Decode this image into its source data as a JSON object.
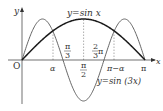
{
  "diagram": {
    "axes": {
      "x_label": "x",
      "y_label": "y",
      "origin_label": "O"
    },
    "curves": [
      {
        "name": "sin-x",
        "label": "y=sin x",
        "color": "#1a1a1a"
      },
      {
        "name": "sin-3x",
        "label": "y=sin (3x)",
        "color": "#555555"
      }
    ],
    "x_ticks": {
      "a": "α",
      "pi_over_3_num": "π",
      "pi_over_3_den": "3",
      "pi_over_2_num": "π",
      "pi_over_2_den": "2",
      "two_thirds_num": "2",
      "two_thirds_den": "3",
      "two_thirds_pi": "π",
      "pi_minus_a": "π−α",
      "pi": "π"
    }
  }
}
